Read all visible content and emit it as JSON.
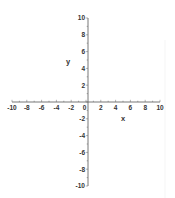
{
  "chart_data": {
    "type": "scatter",
    "title": "",
    "xlabel": "x",
    "ylabel": "y",
    "xlim": [
      -10,
      10
    ],
    "ylim": [
      -10,
      10
    ],
    "grid": false,
    "legend": null,
    "x_ticks": [
      -10,
      -8,
      -6,
      -4,
      -2,
      0,
      2,
      4,
      6,
      8,
      10
    ],
    "x_tick_labels": [
      "-10",
      "-8",
      "-6",
      "-4",
      "-2",
      "0",
      "2",
      "4",
      "6",
      "8",
      "10"
    ],
    "y_ticks": [
      -10,
      -8,
      -6,
      -4,
      -2,
      2,
      4,
      6,
      8,
      10
    ],
    "y_tick_labels": [
      "-10",
      "-8",
      "-6",
      "-4",
      "-2",
      "2",
      "4",
      "6",
      "8",
      "10"
    ],
    "series": [],
    "colors": {
      "axis": "#555555",
      "text": "#333333",
      "background": "#ffffff"
    }
  }
}
